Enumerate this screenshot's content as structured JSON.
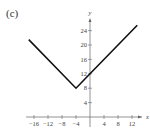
{
  "figure_label": "(c)",
  "chart_data": {
    "type": "line",
    "title": "",
    "xlabel": "x",
    "ylabel": "y",
    "xlim": [
      -18,
      15
    ],
    "ylim": [
      -1,
      27
    ],
    "x_ticks": [
      -16,
      -12,
      -8,
      -4,
      4,
      8,
      12
    ],
    "y_ticks": [
      4,
      8,
      12,
      16,
      20,
      24
    ],
    "grid": false,
    "function": "y = |x + 4| + 8",
    "series": [
      {
        "name": "f(x)",
        "x": [
          -17.5,
          -4,
          0,
          13.5
        ],
        "y": [
          21.5,
          8,
          12,
          25.5
        ]
      }
    ],
    "line_color": "#111111"
  }
}
